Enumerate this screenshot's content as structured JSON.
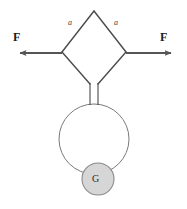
{
  "figure": {
    "colors": {
      "arrow": "#555555",
      "linkage_stroke": "#4a4a4a",
      "ring_stroke": "#7a7a7a",
      "ball_fill": "#d6d6d6",
      "ball_stroke": "#8a8a8a",
      "background": "#ffffff",
      "text": "#1c1c1c"
    },
    "labels": {
      "force_left": "F",
      "force_right": "F",
      "side_left": "a",
      "side_right": "a",
      "weight": "G"
    },
    "geometry": {
      "diamond_top": [
        94,
        11
      ],
      "diamond_left": [
        62,
        52
      ],
      "diamond_right": [
        126,
        52
      ],
      "diamond_bottom": [
        94,
        90
      ],
      "neck_left_x": 90,
      "neck_right_x": 98,
      "neck_top_y": 84,
      "neck_bottom_y": 104,
      "ring_center": [
        94,
        139
      ],
      "ring_radius": 35,
      "ball_center": [
        98,
        179
      ],
      "ball_radius": 16,
      "arrow_left_tip": [
        14,
        53
      ],
      "arrow_left_tail": [
        62,
        53
      ],
      "arrow_right_tail": [
        126,
        53
      ],
      "arrow_right_tip": [
        177,
        53
      ]
    }
  }
}
